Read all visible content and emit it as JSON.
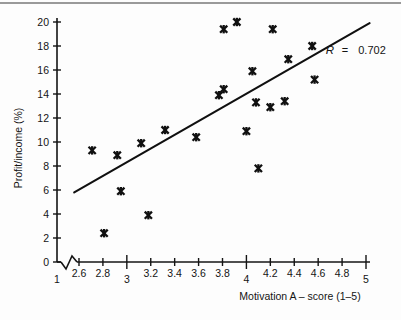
{
  "chart_data": {
    "type": "scatter",
    "title": "",
    "xlabel": "Motivation A – score    (1–5)",
    "ylabel": "Profit/income (%)",
    "xlim": [
      1,
      5
    ],
    "ylim": [
      0,
      20
    ],
    "grid": false,
    "legend": "none",
    "axis_break": true,
    "axis_break_note": "x-axis broken between 1 and 2.6",
    "xticks": [
      {
        "value": 1,
        "label": "1"
      },
      {
        "value": 2.6,
        "label": "2.6"
      },
      {
        "value": 2.8,
        "label": "2.8"
      },
      {
        "value": 3,
        "label": "3"
      },
      {
        "value": 3.2,
        "label": "3.2"
      },
      {
        "value": 3.4,
        "label": "3.4"
      },
      {
        "value": 3.6,
        "label": "3.6"
      },
      {
        "value": 3.8,
        "label": "3.8"
      },
      {
        "value": 4,
        "label": "4"
      },
      {
        "value": 4.2,
        "label": "4.2"
      },
      {
        "value": 4.4,
        "label": "4.4"
      },
      {
        "value": 4.6,
        "label": "4.6"
      },
      {
        "value": 4.8,
        "label": "4.8"
      },
      {
        "value": 5,
        "label": "5"
      }
    ],
    "yticks": [
      {
        "value": 0,
        "label": "0"
      },
      {
        "value": 2,
        "label": "2"
      },
      {
        "value": 4,
        "label": "4"
      },
      {
        "value": 6,
        "label": "6"
      },
      {
        "value": 8,
        "label": "8"
      },
      {
        "value": 10,
        "label": "10"
      },
      {
        "value": 12,
        "label": "12"
      },
      {
        "value": 14,
        "label": "14"
      },
      {
        "value": 16,
        "label": "16"
      },
      {
        "value": 18,
        "label": "18"
      },
      {
        "value": 20,
        "label": "20"
      }
    ],
    "points": [
      {
        "x": 2.71,
        "y": 9.3
      },
      {
        "x": 2.81,
        "y": 2.4
      },
      {
        "x": 2.92,
        "y": 8.9
      },
      {
        "x": 2.95,
        "y": 5.9
      },
      {
        "x": 3.12,
        "y": 9.9
      },
      {
        "x": 3.18,
        "y": 3.9
      },
      {
        "x": 3.32,
        "y": 11.0
      },
      {
        "x": 3.58,
        "y": 10.4
      },
      {
        "x": 3.77,
        "y": 13.9
      },
      {
        "x": 3.81,
        "y": 14.4
      },
      {
        "x": 3.81,
        "y": 19.4
      },
      {
        "x": 3.92,
        "y": 20.0
      },
      {
        "x": 4.0,
        "y": 10.9
      },
      {
        "x": 4.05,
        "y": 15.9
      },
      {
        "x": 4.08,
        "y": 13.3
      },
      {
        "x": 4.1,
        "y": 7.8
      },
      {
        "x": 4.2,
        "y": 12.9
      },
      {
        "x": 4.22,
        "y": 19.4
      },
      {
        "x": 4.32,
        "y": 13.4
      },
      {
        "x": 4.35,
        "y": 16.9
      },
      {
        "x": 4.55,
        "y": 18.0
      },
      {
        "x": 4.57,
        "y": 15.2
      }
    ],
    "fit_line": {
      "x1": 2.56,
      "y1": 5.8,
      "x2": 5.03,
      "y2": 19.9
    },
    "annotation": {
      "r_symbol": "R",
      "equals": "=",
      "r_value": "0.702"
    }
  }
}
